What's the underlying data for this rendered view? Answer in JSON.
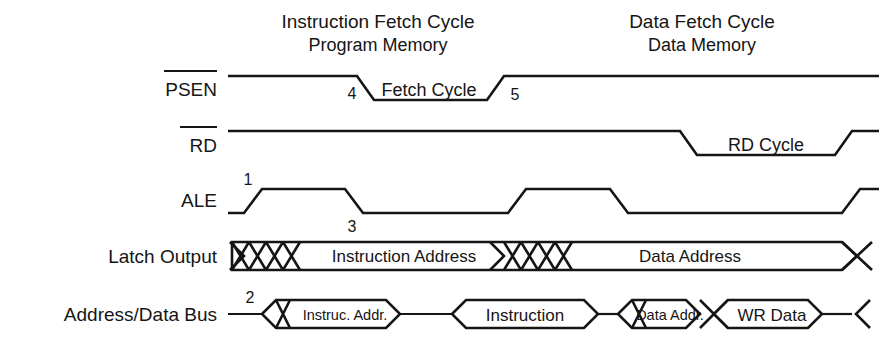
{
  "diagram": {
    "background_color": "#ffffff",
    "line_color": "#151515",
    "headers": [
      {
        "title": "Instruction Fetch Cycle",
        "subtitle": "Program Memory"
      },
      {
        "title": "Data Fetch Cycle",
        "subtitle": "Data Memory"
      }
    ],
    "signals": [
      {
        "name": "PSEN",
        "label": "PSEN",
        "active_low": true,
        "overbar": true
      },
      {
        "name": "RD",
        "label": "RD",
        "active_low": true,
        "overbar": true
      },
      {
        "name": "ALE",
        "label": "ALE",
        "active_low": false,
        "overbar": false
      },
      {
        "name": "Latch Output",
        "label": "Latch Output",
        "active_low": false,
        "overbar": false
      },
      {
        "name": "Address/Data Bus",
        "label": "Address/Data Bus",
        "active_low": false,
        "overbar": false
      }
    ],
    "cycle_labels": [
      {
        "text": "Fetch Cycle",
        "signal": "PSEN"
      },
      {
        "text": "RD Cycle",
        "signal": "RD"
      }
    ],
    "bus_segments": {
      "latch_output": [
        {
          "text": "",
          "kind": "hatch"
        },
        {
          "text": "Instruction Address",
          "kind": "data"
        },
        {
          "text": "",
          "kind": "hatch"
        },
        {
          "text": "Data Address",
          "kind": "data"
        }
      ],
      "address_data_bus": [
        {
          "text": "Instruc. Addr.",
          "kind": "data"
        },
        {
          "text": "Instruction",
          "kind": "data"
        },
        {
          "text": "Data Addr.",
          "kind": "data"
        },
        {
          "text": "WR Data",
          "kind": "data"
        }
      ]
    },
    "markers": [
      {
        "id": "1",
        "signal": "ALE",
        "meaning": "ALE rising edge"
      },
      {
        "id": "2",
        "signal": "Address/Data Bus",
        "meaning": "Address placed on bus"
      },
      {
        "id": "3",
        "signal": "ALE",
        "meaning": "ALE falling edge latches address"
      },
      {
        "id": "4",
        "signal": "PSEN",
        "meaning": "PSEN falling edge"
      },
      {
        "id": "5",
        "signal": "PSEN",
        "meaning": "PSEN rising edge"
      }
    ]
  }
}
